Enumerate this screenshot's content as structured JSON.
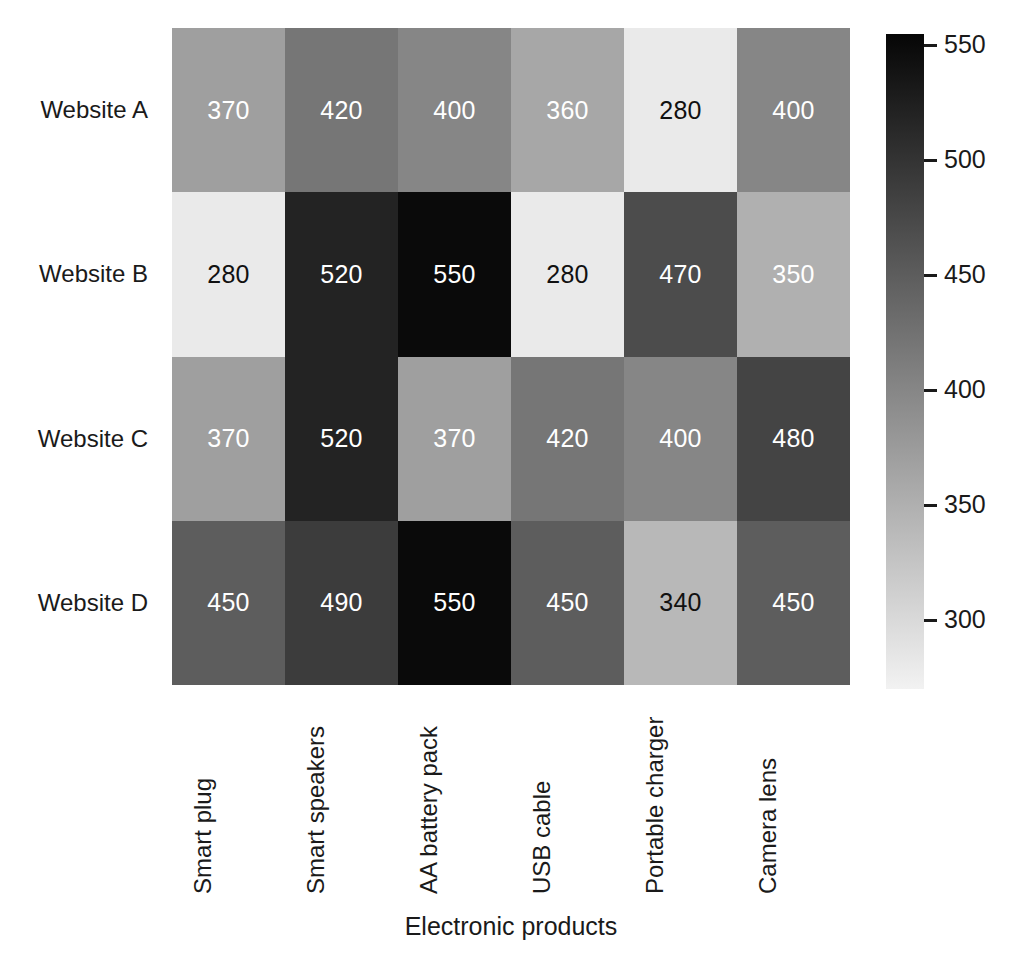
{
  "chart_data": {
    "type": "heatmap",
    "title": "",
    "xlabel": "Electronic products",
    "ylabel": "",
    "categories_x": [
      "Smart plug",
      "Smart speakers",
      "AA battery pack",
      "USB cable",
      "Portable charger",
      "Camera lens"
    ],
    "categories_y": [
      "Website A",
      "Website B",
      "Website C",
      "Website D"
    ],
    "values": [
      [
        370,
        420,
        400,
        360,
        280,
        400
      ],
      [
        280,
        520,
        550,
        280,
        470,
        350
      ],
      [
        370,
        520,
        370,
        420,
        400,
        480
      ],
      [
        450,
        490,
        550,
        450,
        340,
        450
      ]
    ],
    "annotate_cells": true,
    "colormap": "gray_r",
    "colorbar": {
      "position": "right",
      "ticks": [
        550,
        500,
        450,
        400,
        350,
        300
      ],
      "vmin": 270,
      "vmax": 555,
      "low_color": "#f2f2f2",
      "high_color": "#060606"
    },
    "grid": false,
    "legend": "none"
  },
  "axes": {
    "x_title": "Electronic products",
    "x_ticklabels": [
      "Smart plug",
      "Smart speakers",
      "AA battery pack",
      "USB cable",
      "Portable charger",
      "Camera lens"
    ],
    "y_ticklabels": [
      "Website A",
      "Website B",
      "Website C",
      "Website D"
    ]
  },
  "colorbar_ticklabels": [
    "550",
    "500",
    "450",
    "400",
    "350",
    "300"
  ],
  "cells": [
    {
      "row": "Website A",
      "col": "Smart plug",
      "value": "370",
      "text_color": "light"
    },
    {
      "row": "Website A",
      "col": "Smart speakers",
      "value": "420",
      "text_color": "light"
    },
    {
      "row": "Website A",
      "col": "AA battery pack",
      "value": "400",
      "text_color": "light"
    },
    {
      "row": "Website A",
      "col": "USB cable",
      "value": "360",
      "text_color": "light"
    },
    {
      "row": "Website A",
      "col": "Portable charger",
      "value": "280",
      "text_color": "dark"
    },
    {
      "row": "Website A",
      "col": "Camera lens",
      "value": "400",
      "text_color": "light"
    },
    {
      "row": "Website B",
      "col": "Smart plug",
      "value": "280",
      "text_color": "dark"
    },
    {
      "row": "Website B",
      "col": "Smart speakers",
      "value": "520",
      "text_color": "light"
    },
    {
      "row": "Website B",
      "col": "AA battery pack",
      "value": "550",
      "text_color": "light"
    },
    {
      "row": "Website B",
      "col": "USB cable",
      "value": "280",
      "text_color": "dark"
    },
    {
      "row": "Website B",
      "col": "Portable charger",
      "value": "470",
      "text_color": "light"
    },
    {
      "row": "Website B",
      "col": "Camera lens",
      "value": "350",
      "text_color": "light"
    },
    {
      "row": "Website C",
      "col": "Smart plug",
      "value": "370",
      "text_color": "light"
    },
    {
      "row": "Website C",
      "col": "Smart speakers",
      "value": "520",
      "text_color": "light"
    },
    {
      "row": "Website C",
      "col": "AA battery pack",
      "value": "370",
      "text_color": "light"
    },
    {
      "row": "Website C",
      "col": "USB cable",
      "value": "420",
      "text_color": "light"
    },
    {
      "row": "Website C",
      "col": "Portable charger",
      "value": "400",
      "text_color": "light"
    },
    {
      "row": "Website C",
      "col": "Camera lens",
      "value": "480",
      "text_color": "light"
    },
    {
      "row": "Website D",
      "col": "Smart plug",
      "value": "450",
      "text_color": "light"
    },
    {
      "row": "Website D",
      "col": "Smart speakers",
      "value": "490",
      "text_color": "light"
    },
    {
      "row": "Website D",
      "col": "AA battery pack",
      "value": "550",
      "text_color": "light"
    },
    {
      "row": "Website D",
      "col": "USB cable",
      "value": "450",
      "text_color": "light"
    },
    {
      "row": "Website D",
      "col": "Portable charger",
      "value": "340",
      "text_color": "dark"
    },
    {
      "row": "Website D",
      "col": "Camera lens",
      "value": "450",
      "text_color": "light"
    }
  ]
}
